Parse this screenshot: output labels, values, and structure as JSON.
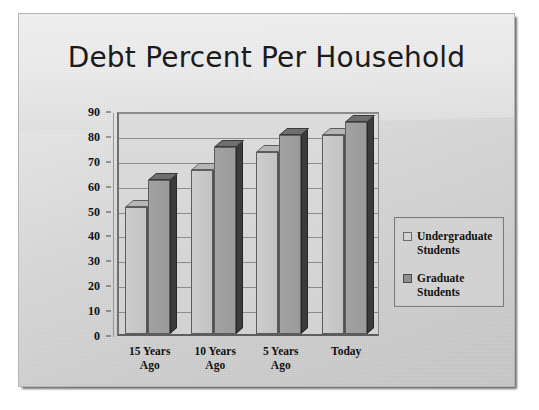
{
  "slide": {
    "title": "Debt Percent Per Household"
  },
  "legend": {
    "items": [
      {
        "label": "Undergraduate\nStudents",
        "swatch": "#d4d4d4"
      },
      {
        "label": "Graduate\nStudents",
        "swatch": "#8f8f8f"
      }
    ]
  },
  "chart_data": {
    "type": "bar",
    "title": "Debt Percent Per Household",
    "xlabel": "",
    "ylabel": "",
    "ylim": [
      0,
      90
    ],
    "yticks": [
      0,
      10,
      20,
      30,
      40,
      50,
      60,
      70,
      80,
      90
    ],
    "grid": true,
    "legend_position": "right",
    "categories": [
      "15 Years\nAgo",
      "10 Years\nAgo",
      "5 Years\nAgo",
      "Today"
    ],
    "series": [
      {
        "name": "Undergraduate Students",
        "values": [
          51,
          66,
          73,
          80
        ],
        "color": "#c7c7c7"
      },
      {
        "name": "Graduate Students",
        "values": [
          62,
          75,
          80,
          85
        ],
        "color": "#9e9e9e"
      }
    ]
  }
}
